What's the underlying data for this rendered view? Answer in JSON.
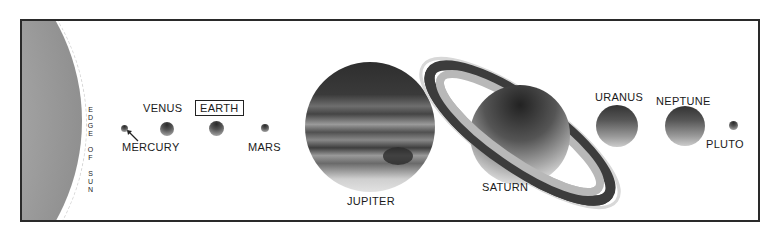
{
  "diagram": {
    "sun_label": "EDGE OF SUN",
    "planets": [
      {
        "name": "MERCURY",
        "highlighted": false
      },
      {
        "name": "VENUS",
        "highlighted": false
      },
      {
        "name": "EARTH",
        "highlighted": true
      },
      {
        "name": "MARS",
        "highlighted": false
      },
      {
        "name": "JUPITER",
        "highlighted": false
      },
      {
        "name": "SATURN",
        "highlighted": false
      },
      {
        "name": "URANUS",
        "highlighted": false
      },
      {
        "name": "NEPTUNE",
        "highlighted": false
      },
      {
        "name": "PLUTO",
        "highlighted": false
      }
    ],
    "colors": {
      "frame": "#2a2a2a",
      "background": "#ffffff",
      "text": "#1a1a1a"
    }
  }
}
